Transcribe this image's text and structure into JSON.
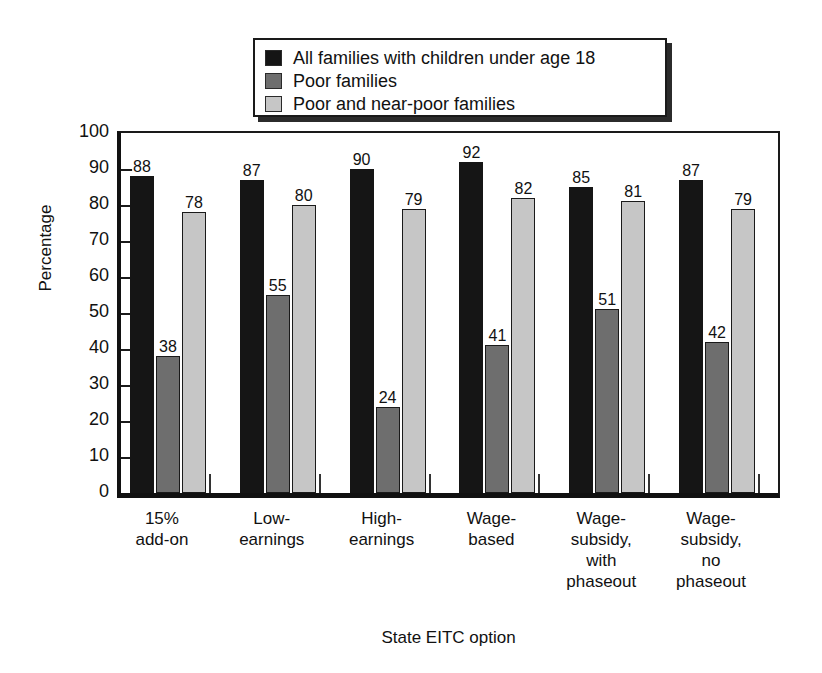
{
  "chart_data": {
    "type": "bar",
    "title": "",
    "xlabel": "State EITC option",
    "ylabel": "Percentage",
    "ylim": [
      0,
      100
    ],
    "yticks": [
      0,
      10,
      20,
      30,
      40,
      50,
      60,
      70,
      80,
      90,
      100
    ],
    "grid": false,
    "legend_position": "top-center",
    "categories": [
      "15%\nadd-on",
      "Low-\nearnings",
      "High-\nearnings",
      "Wage-\nbased",
      "Wage-\nsubsidy,\nwith\nphaseout",
      "Wage-\nsubsidy,\nno\nphaseout"
    ],
    "category_lines": [
      [
        "15%",
        "add-on"
      ],
      [
        "Low-",
        "earnings"
      ],
      [
        "High-",
        "earnings"
      ],
      [
        "Wage-",
        "based"
      ],
      [
        "Wage-",
        "subsidy,",
        "with",
        "phaseout"
      ],
      [
        "Wage-",
        "subsidy,",
        "no",
        "phaseout"
      ]
    ],
    "series": [
      {
        "name": "All families with children under age 18",
        "color": "#151515",
        "values": [
          88,
          87,
          90,
          92,
          85,
          87
        ]
      },
      {
        "name": "Poor families",
        "color": "#6e6e6e",
        "values": [
          38,
          55,
          24,
          41,
          51,
          42
        ]
      },
      {
        "name": "Poor and near-poor families",
        "color": "#c6c6c6",
        "values": [
          78,
          80,
          79,
          82,
          81,
          79
        ]
      }
    ]
  },
  "legend": {
    "items": [
      {
        "label": "All families with children under age 18",
        "color": "#151515"
      },
      {
        "label": "Poor families",
        "color": "#6e6e6e"
      },
      {
        "label": "Poor and near-poor families",
        "color": "#c6c6c6"
      }
    ]
  },
  "axes": {
    "y_title": "Percentage",
    "x_title": "State EITC option",
    "y_tick_labels": [
      "100",
      "90",
      "80",
      "70",
      "60",
      "50",
      "40",
      "30",
      "20",
      "10",
      "0"
    ]
  }
}
